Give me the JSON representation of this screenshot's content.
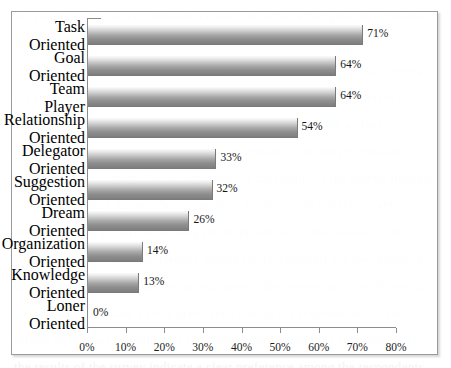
{
  "chart_data": {
    "type": "bar",
    "orientation": "horizontal",
    "title": "",
    "subtitle": "",
    "xlabel": "",
    "ylabel": "",
    "xlim": [
      0,
      80
    ],
    "grid": false,
    "legend": null,
    "tick_suffix": "%",
    "x_ticks": [
      "0%",
      "10%",
      "20%",
      "30%",
      "40%",
      "50%",
      "60%",
      "70%",
      "80%"
    ],
    "x_tick_values": [
      0,
      10,
      20,
      30,
      40,
      50,
      60,
      70,
      80
    ],
    "categories": [
      "Task Oriented",
      "Goal Oriented",
      "Team Player",
      "Relationship Oriented",
      "Delegator Oriented",
      "Suggestion Oriented",
      "Dream Oriented",
      "Organization Oriented",
      "Knowledge Oriented",
      "Loner Oriented"
    ],
    "values": [
      71,
      64,
      64,
      54,
      33,
      32,
      26,
      14,
      13,
      0
    ],
    "value_labels": [
      "71%",
      "64%",
      "64%",
      "54%",
      "33%",
      "32%",
      "26%",
      "14%",
      "13%",
      "0%"
    ],
    "bars": [
      {
        "category_lines": [
          "Task",
          "Oriented"
        ],
        "value": 71,
        "label": "71%"
      },
      {
        "category_lines": [
          "Goal",
          "Oriented"
        ],
        "value": 64,
        "label": "64%"
      },
      {
        "category_lines": [
          "Team Player"
        ],
        "value": 64,
        "label": "64%"
      },
      {
        "category_lines": [
          "Relationship",
          "Oriented"
        ],
        "value": 54,
        "label": "54%"
      },
      {
        "category_lines": [
          "Delegator",
          "Oriented"
        ],
        "value": 33,
        "label": "33%"
      },
      {
        "category_lines": [
          "Suggestion",
          "Oriented"
        ],
        "value": 32,
        "label": "32%"
      },
      {
        "category_lines": [
          "Dream",
          "Oriented"
        ],
        "value": 26,
        "label": "26%"
      },
      {
        "category_lines": [
          "Organization",
          "Oriented"
        ],
        "value": 14,
        "label": "14%"
      },
      {
        "category_lines": [
          "Knowledge",
          "Oriented"
        ],
        "value": 13,
        "label": "13%"
      },
      {
        "category_lines": [
          "Loner",
          "Oriented"
        ],
        "value": 0,
        "label": "0%"
      }
    ],
    "colors": {
      "bar_gradient_top": "#fbfbfb",
      "bar_gradient_bottom": "#7d7d7d",
      "axis": "#8d8d8d",
      "frame_border": "#9a9a9a",
      "text": "#161616",
      "background": "#ffffff"
    }
  }
}
